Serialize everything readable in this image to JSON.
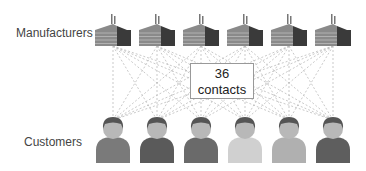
{
  "labels": {
    "manufacturers": "Manufacturers",
    "customers": "Customers"
  },
  "center_box": {
    "count": "36",
    "text": "contacts"
  },
  "manufacturers": {
    "count": 6,
    "x_centers": [
      113,
      157,
      201,
      245,
      289,
      333
    ]
  },
  "customers": {
    "count": 6,
    "x_centers": [
      113,
      157,
      201,
      245,
      289,
      333
    ],
    "body_colors": [
      "#7a7a7a",
      "#5a5a5a",
      "#6a6a6a",
      "#d0d0d0",
      "#b0b0b0",
      "#5e5e5e"
    ]
  },
  "colors": {
    "line": "#bbbbbb",
    "factory_light": "#8a8a8a",
    "factory_dark": "#3a3a3a",
    "head": "#b8b8b8",
    "hair": "#555555"
  }
}
